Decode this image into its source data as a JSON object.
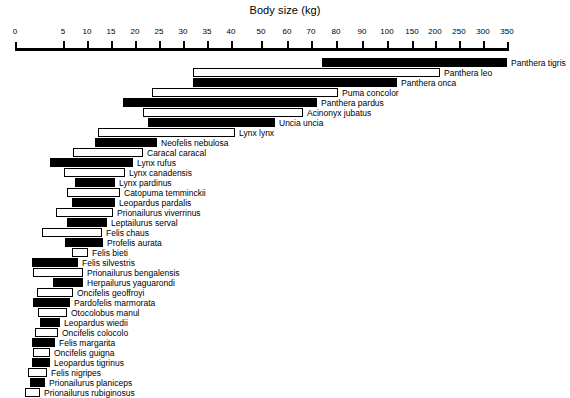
{
  "chart_data": {
    "type": "bar",
    "title": "Body size (kg)",
    "xlabel": "Body size (kg)",
    "ylabel": "",
    "orientation": "horizontal",
    "axis_scale": "piecewise-compressed",
    "grid": false,
    "legend": null,
    "axis_ticks": [
      {
        "label": "0",
        "value": 0,
        "px": 15
      },
      {
        "label": "5",
        "value": 5,
        "px": 63
      },
      {
        "label": "10",
        "value": 10,
        "px": 87
      },
      {
        "label": "15",
        "value": 15,
        "px": 111
      },
      {
        "label": "20",
        "value": 20,
        "px": 135
      },
      {
        "label": "25",
        "value": 25,
        "px": 159
      },
      {
        "label": "30",
        "value": 30,
        "px": 183
      },
      {
        "label": "35",
        "value": 35,
        "px": 207
      },
      {
        "label": "40",
        "value": 40,
        "px": 231
      },
      {
        "label": "50",
        "value": 50,
        "px": 261
      },
      {
        "label": "60",
        "value": 60,
        "px": 287
      },
      {
        "label": "70",
        "value": 70,
        "px": 311
      },
      {
        "label": "80",
        "value": 80,
        "px": 336
      },
      {
        "label": "90",
        "value": 90,
        "px": 362
      },
      {
        "label": "100",
        "value": 100,
        "px": 387
      },
      {
        "label": "150",
        "value": 150,
        "px": 412
      },
      {
        "label": "200",
        "value": 200,
        "px": 435
      },
      {
        "label": "250",
        "value": 250,
        "px": 459
      },
      {
        "label": "300",
        "value": 300,
        "px": 483
      },
      {
        "label": "350",
        "value": 350,
        "px": 507
      }
    ],
    "categories": [
      "Panthera tigris",
      "Panthera leo",
      "Panthera onca",
      "Puma concolor",
      "Panthera pardus",
      "Acinonyx jubatus",
      "Uncia uncia",
      "Lynx lynx",
      "Neofelis nebulosa",
      "Caracal caracal",
      "Lynx rufus",
      "Lynx canadensis",
      "Lynx pardinus",
      "Catopuma temminckii",
      "Leopardus pardalis",
      "Prionailurus viverrinus",
      "Leptailurus serval",
      "Felis chaus",
      "Profelis aurata",
      "Felis bieti",
      "Felis silvestris",
      "Prionailurus bengalensis",
      "Herpailurus yaguarondi",
      "Oncifelis geoffroyi",
      "Pardofelis marmorata",
      "Otocolobus manul",
      "Leopardus wiedii",
      "Oncifelis colocolo",
      "Felis margarita",
      "Oncifelis guigna",
      "Leopardus tigrinus",
      "Felis nigripes",
      "Prionailurus planiceps",
      "Prionailurus rubiginosus"
    ],
    "series": [
      {
        "name": "Body size range (kg)",
        "note": "each bar spans minimum to maximum recorded adult body mass"
      }
    ],
    "bars": [
      {
        "label": "Panthera tigris",
        "min_kg": 75,
        "max_kg": 350,
        "style": "filled",
        "x0": 322,
        "x1": 507,
        "y": 58,
        "label_x": 511,
        "label_y": 59,
        "leader": null
      },
      {
        "label": "Panthera leo",
        "min_kg": 30,
        "max_kg": 205,
        "style": "open",
        "x0": 193,
        "x1": 440,
        "y": 68,
        "label_x": 444,
        "label_y": 69,
        "leader": null
      },
      {
        "label": "Panthera onca",
        "min_kg": 30,
        "max_kg": 120,
        "style": "filled",
        "x0": 193,
        "x1": 397,
        "y": 78,
        "label_x": 401,
        "label_y": 79,
        "leader": null
      },
      {
        "label": "Puma concolor",
        "min_kg": 22,
        "max_kg": 80,
        "style": "open",
        "x0": 152,
        "x1": 338,
        "y": 88,
        "label_x": 342,
        "label_y": 89,
        "leader": null
      },
      {
        "label": "Panthera pardus",
        "min_kg": 17,
        "max_kg": 72,
        "style": "filled",
        "x0": 123,
        "x1": 317,
        "y": 98,
        "label_x": 321,
        "label_y": 99,
        "leader": null
      },
      {
        "label": "Acinonyx jubatus",
        "min_kg": 21,
        "max_kg": 63,
        "style": "open",
        "x0": 143,
        "x1": 303,
        "y": 108,
        "label_x": 307,
        "label_y": 109,
        "leader": null
      },
      {
        "label": "Uncia uncia",
        "min_kg": 22,
        "max_kg": 52,
        "style": "filled",
        "x0": 148,
        "x1": 275,
        "y": 118,
        "label_x": 279,
        "label_y": 119,
        "leader": null
      },
      {
        "label": "Lynx lynx",
        "min_kg": 12,
        "max_kg": 38,
        "style": "open",
        "x0": 98,
        "x1": 235,
        "y": 128,
        "label_x": 239,
        "label_y": 129,
        "leader": null
      },
      {
        "label": "Neofelis nebulosa",
        "min_kg": 11,
        "max_kg": 23,
        "style": "filled",
        "x0": 95,
        "x1": 157,
        "y": 138,
        "label_x": 161,
        "label_y": 139,
        "leader": null
      },
      {
        "label": "Caracal caracal",
        "min_kg": 7,
        "max_kg": 19,
        "style": "open",
        "x0": 73,
        "x1": 143,
        "y": 148,
        "label_x": 147,
        "label_y": 149,
        "leader": null
      },
      {
        "label": "Lynx rufus",
        "min_kg": 4,
        "max_kg": 17,
        "style": "filled",
        "x0": 50,
        "x1": 133,
        "y": 158,
        "label_x": 137,
        "label_y": 159,
        "leader": null
      },
      {
        "label": "Lynx canadensis",
        "min_kg": 5.5,
        "max_kg": 16,
        "style": "open",
        "x0": 64,
        "x1": 125,
        "y": 168,
        "label_x": 129,
        "label_y": 169,
        "leader": null
      },
      {
        "label": "Lynx pardinus",
        "min_kg": 7,
        "max_kg": 14,
        "style": "filled",
        "x0": 75,
        "x1": 115,
        "y": 178,
        "label_x": 119,
        "label_y": 179,
        "leader": null
      },
      {
        "label": "Catopuma temminckii",
        "min_kg": 6,
        "max_kg": 15,
        "style": "open",
        "x0": 67,
        "x1": 120,
        "y": 188,
        "label_x": 124,
        "label_y": 189,
        "leader": null
      },
      {
        "label": "Leopardus pardalis",
        "min_kg": 6.5,
        "max_kg": 14,
        "style": "filled",
        "x0": 72,
        "x1": 115,
        "y": 198,
        "label_x": 119,
        "label_y": 199,
        "leader": null
      },
      {
        "label": "Prionailurus viverrinus",
        "min_kg": 4,
        "max_kg": 13,
        "style": "open",
        "x0": 56,
        "x1": 113,
        "y": 208,
        "label_x": 117,
        "label_y": 209,
        "leader": null
      },
      {
        "label": "Leptailurus serval",
        "min_kg": 6,
        "max_kg": 12,
        "style": "filled",
        "x0": 67,
        "x1": 107,
        "y": 218,
        "label_x": 111,
        "label_y": 219,
        "leader": null
      },
      {
        "label": "Felis chaus",
        "min_kg": 3,
        "max_kg": 11,
        "style": "open",
        "x0": 42,
        "x1": 102,
        "y": 228,
        "label_x": 106,
        "label_y": 229,
        "leader": null
      },
      {
        "label": "Profelis aurata",
        "min_kg": 5.5,
        "max_kg": 11,
        "style": "filled",
        "x0": 65,
        "x1": 103,
        "y": 238,
        "label_x": 107,
        "label_y": 239,
        "leader": null
      },
      {
        "label": "Felis bieti",
        "min_kg": 6.5,
        "max_kg": 9,
        "style": "open",
        "x0": 72,
        "x1": 88,
        "y": 248,
        "label_x": 92,
        "label_y": 249,
        "leader": null
      },
      {
        "label": "Felis silvestris",
        "min_kg": 2,
        "max_kg": 8,
        "style": "filled",
        "x0": 32,
        "x1": 78,
        "y": 258,
        "label_x": 82,
        "label_y": 259,
        "leader": null
      },
      {
        "label": "Prionailurus bengalensis",
        "min_kg": 2,
        "max_kg": 8.5,
        "style": "open",
        "x0": 33,
        "x1": 83,
        "y": 268,
        "label_x": 87,
        "label_y": 269,
        "leader": null
      },
      {
        "label": "Herpailurus yaguarondi",
        "min_kg": 4.5,
        "max_kg": 8.5,
        "style": "filled",
        "x0": 53,
        "x1": 83,
        "y": 278,
        "label_x": 87,
        "label_y": 279,
        "leader": null
      },
      {
        "label": "Oncifelis geoffroyi",
        "min_kg": 2.3,
        "max_kg": 7.5,
        "style": "open",
        "x0": 37,
        "x1": 73,
        "y": 288,
        "label_x": 77,
        "label_y": 289,
        "leader": null
      },
      {
        "label": "Pardofelis marmorata",
        "min_kg": 2,
        "max_kg": 7,
        "style": "filled",
        "x0": 33,
        "x1": 70,
        "y": 298,
        "label_x": 74,
        "label_y": 299,
        "leader": null
      },
      {
        "label": "Otocolobus manul",
        "min_kg": 2.4,
        "max_kg": 6.5,
        "style": "open",
        "x0": 38,
        "x1": 67,
        "y": 308,
        "label_x": 71,
        "label_y": 309,
        "leader": null
      },
      {
        "label": "Leopardus wiedii",
        "min_kg": 2.6,
        "max_kg": 5,
        "style": "filled",
        "x0": 40,
        "x1": 60,
        "y": 318,
        "label_x": 64,
        "label_y": 319,
        "leader": null
      },
      {
        "label": "Oncifelis colocolo",
        "min_kg": 2,
        "max_kg": 4.6,
        "style": "open",
        "x0": 35,
        "x1": 58,
        "y": 328,
        "label_x": 62,
        "label_y": 329,
        "leader": null
      },
      {
        "label": "Felis margarita",
        "min_kg": 1.8,
        "max_kg": 4.3,
        "style": "filled",
        "x0": 32,
        "x1": 55,
        "y": 338,
        "label_x": 59,
        "label_y": 339,
        "leader": null
      },
      {
        "label": "Oncifelis guigna",
        "min_kg": 1.9,
        "max_kg": 3.7,
        "style": "open",
        "x0": 33,
        "x1": 50,
        "y": 348,
        "label_x": 54,
        "label_y": 349,
        "leader": null
      },
      {
        "label": "Leopardus tigrinus",
        "min_kg": 1.8,
        "max_kg": 3.7,
        "style": "filled",
        "x0": 32,
        "x1": 50,
        "y": 358,
        "label_x": 54,
        "label_y": 359,
        "leader": null
      },
      {
        "label": "Felis nigripes",
        "min_kg": 1.4,
        "max_kg": 3.3,
        "style": "open",
        "x0": 28,
        "x1": 47,
        "y": 368,
        "label_x": 51,
        "label_y": 369,
        "leader": null
      },
      {
        "label": "Prionailurus planiceps",
        "min_kg": 1.6,
        "max_kg": 3.1,
        "style": "filled",
        "x0": 30,
        "x1": 45,
        "y": 378,
        "label_x": 49,
        "label_y": 379,
        "leader": null
      },
      {
        "label": "Prionailurus rubiginosus",
        "min_kg": 1.1,
        "max_kg": 2.6,
        "style": "open",
        "x0": 25,
        "x1": 40,
        "y": 388,
        "label_x": 44,
        "label_y": 389,
        "leader": null
      }
    ]
  }
}
